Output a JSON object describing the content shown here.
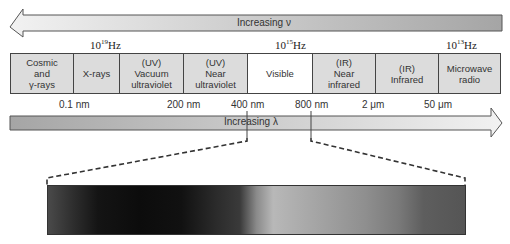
{
  "frequency_arrow": {
    "label": "Increasing ν",
    "direction": "left"
  },
  "frequency_ticks": [
    {
      "base": "10",
      "exp": "19",
      "unit": "Hz"
    },
    {
      "base": "10",
      "exp": "15",
      "unit": "Hz"
    },
    {
      "base": "10",
      "exp": "13",
      "unit": "Hz"
    }
  ],
  "bands": [
    {
      "label": "Cosmic\nand\nγ-rays",
      "width": 62
    },
    {
      "label": "X-rays",
      "width": 47
    },
    {
      "label": "(UV)\nVacuum\nultraviolet",
      "width": 64
    },
    {
      "label": "(UV)\nNear\nultraviolet",
      "width": 64
    },
    {
      "label": "Visible",
      "width": 64
    },
    {
      "label": "(IR)\nNear\ninfrared",
      "width": 64
    },
    {
      "label": "(IR)\nInfrared",
      "width": 63
    },
    {
      "label": "Microwave\nradio",
      "width": 63
    }
  ],
  "wavelength_ticks": [
    "0.1 nm",
    "200 nm",
    "400 nm",
    "800 nm",
    "2 μm",
    "50 μm"
  ],
  "wavelength_arrow": {
    "label": "Increasing λ",
    "direction": "right"
  },
  "colors": {
    "band_fill": "#dcdcdc",
    "visible_fill": "#ffffff",
    "border": "#444444",
    "arrow_light": "#f0f0f0",
    "arrow_dark": "#a8a8a8"
  }
}
